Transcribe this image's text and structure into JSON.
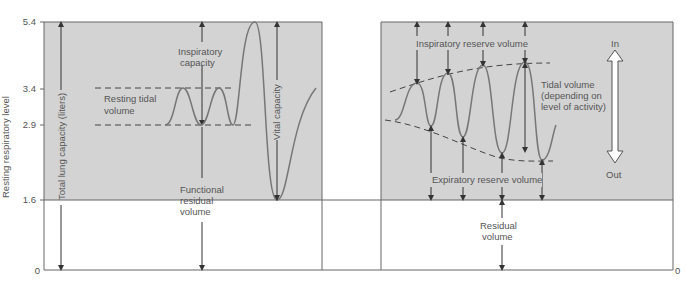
{
  "axis": {
    "ylabel": "Resting respiratory level",
    "ticks": [
      {
        "label": "5.4",
        "value": 5.4
      },
      {
        "label": "3.4",
        "value": 3.4
      },
      {
        "label": "2.9",
        "value": 2.9
      },
      {
        "label": "1.6",
        "value": 1.6
      },
      {
        "label": "0",
        "value": 0
      }
    ],
    "right_zero": "0"
  },
  "left_panel": {
    "total_lung_capacity": "Total lung capacity (liters)",
    "inspiratory_capacity": [
      "Inspiratory",
      "capacity"
    ],
    "resting_tidal_volume": [
      "Resting tidal",
      "volume"
    ],
    "vital_capacity": "Vital capacity",
    "functional_residual_volume": [
      "Functional",
      "residual",
      "volume"
    ]
  },
  "right_panel": {
    "inspiratory_reserve_volume": "Inspiratory reserve volume",
    "tidal_volume": [
      "Tidal volume",
      "(depending on",
      "level of activity)"
    ],
    "expiratory_reserve_volume": "Expiratory reserve volume",
    "residual_volume": [
      "Residual",
      "volume"
    ],
    "in_label": "In",
    "out_label": "Out"
  },
  "colors": {
    "shade": "#d3d3d3",
    "line": "#555555",
    "curve": "#777777"
  }
}
